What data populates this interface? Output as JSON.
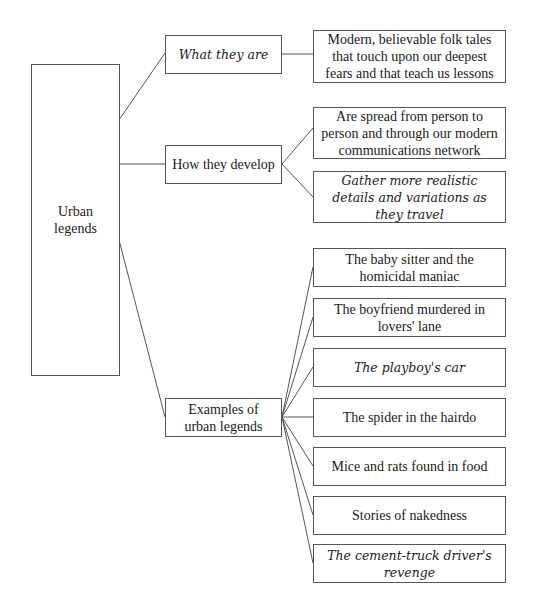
{
  "root": {
    "label": "Urban legends"
  },
  "branches": [
    {
      "label": "What they are",
      "italic": true,
      "children": [
        {
          "label": "Modern, believable folk tales that touch upon our deepest fears and that teach us lessons",
          "italic": false
        }
      ]
    },
    {
      "label": "How they develop",
      "italic": false,
      "children": [
        {
          "label": "Are spread from person to person and through our modern communications network",
          "italic": false
        },
        {
          "label": "Gather more realistic details and variations as they travel",
          "italic": true
        }
      ]
    },
    {
      "label": "Examples of urban legends",
      "italic": false,
      "children": [
        {
          "label": "The baby sitter and the homicidal maniac",
          "italic": false
        },
        {
          "label": "The boyfriend murdered in lovers' lane",
          "italic": false
        },
        {
          "label": "The playboy's car",
          "italic": true
        },
        {
          "label": "The spider in the hairdo",
          "italic": false
        },
        {
          "label": "Mice and rats found in food",
          "italic": false
        },
        {
          "label": "Stories of nakedness",
          "italic": false
        },
        {
          "label": "The cement-truck driver's revenge",
          "italic": true
        }
      ]
    }
  ]
}
